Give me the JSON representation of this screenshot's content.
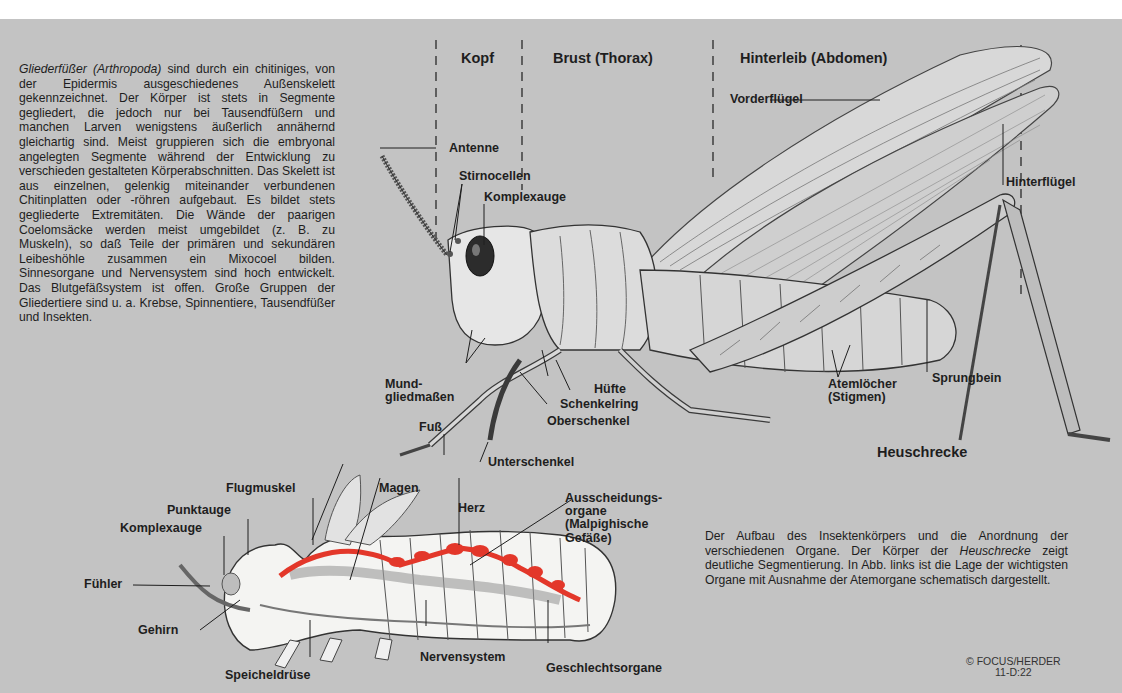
{
  "intro": {
    "lead_italic": "Gliederfüßer (Arthropoda)",
    "text": " sind durch ein chitiniges, von der Epidermis ausgeschiedenes Außenskelett gekennzeichnet. Der Körper ist stets in Segmente gegliedert, die jedoch nur bei Tausendfüßern und manchen Larven wenigstens äußerlich annähernd gleichartig sind. Meist gruppieren sich die embryonal angelegten Segmente während der Entwicklung zu verschieden gestalteten Körperabschnitten. Das Skelett ist aus einzelnen, gelenkig miteinander verbundenen Chitinplatten oder -röhren aufgebaut. Es bildet stets gegliederte Extremitäten. Die Wände der paarigen Coelomsäcke werden meist umgebildet (z. B. zu Muskeln), so daß Teile der primären und sekundären Leibeshöhle zusammen ein Mixocoel bilden. Sinnesorgane und Nervensystem sind hoch entwickelt. Das Blutgefäßsystem ist offen. Große Gruppen der Gliedertiere sind u. a. Krebse, Spinnentiere, Tausendfüßer und Insekten."
  },
  "external_diagram": {
    "title": "Heuschrecke",
    "regions": [
      "Kopf",
      "Brust (Thorax)",
      "Hinterleib (Abdomen)"
    ],
    "labels": {
      "antenne": "Antenne",
      "stirnocellen": "Stirnocellen",
      "komplexauge": "Komplexauge",
      "vorderfluegel": "Vorderflügel",
      "hinterfluegel": "Hinterflügel",
      "mundgliedmassen": "Mund-\ngliedmaßen",
      "huefte": "Hüfte",
      "schenkelring": "Schenkelring",
      "oberschenkel": "Oberschenkel",
      "fuss": "Fuß",
      "unterschenkel": "Unterschenkel",
      "atemloecher": "Atemlöcher\n(Stigmen)",
      "sprungbein": "Sprungbein"
    }
  },
  "internal_diagram": {
    "labels": {
      "flugmuskel": "Flugmuskel",
      "magen": "Magen",
      "punktauge": "Punktauge",
      "komplexauge": "Komplexauge",
      "herz": "Herz",
      "ausscheidungsorgane": "Ausscheidungs-\norgane\n(Malpighische\nGefäße)",
      "fuehler": "Fühler",
      "gehirn": "Gehirn",
      "speicheldruese": "Speicheldrüse",
      "nervensystem": "Nervensystem",
      "geschlechtsorgane": "Geschlechtsorgane"
    },
    "colors": {
      "heart": "#e3372a",
      "body": "#f4f4f2",
      "background": "#c3c3c3"
    }
  },
  "caption": {
    "part1": "Der Aufbau des Insektenkörpers und die Anordnung der verschiedenen Organe. Der Körper der ",
    "italic": "Heuschrecke",
    "part2": " zeigt deutliche Segmentierung. In Abb. links ist die Lage der wichtigsten Organe mit Ausnahme der Atemorgane schematisch dargestellt."
  },
  "copyright": {
    "line1": "© FOCUS/HERDER",
    "line2": "11-D:22"
  }
}
